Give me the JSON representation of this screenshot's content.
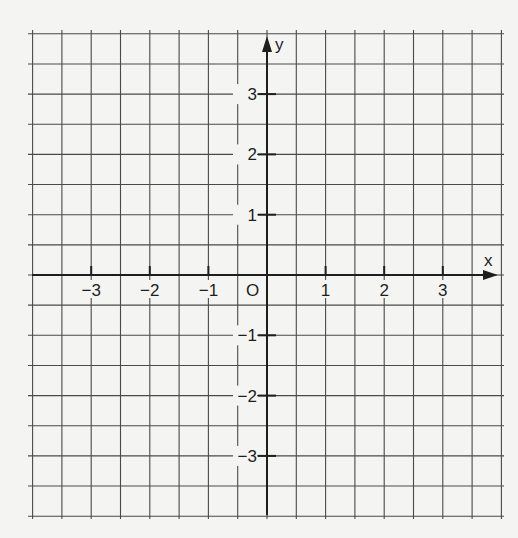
{
  "chart_data": {
    "type": "scatter",
    "title": "",
    "xlabel": "x",
    "ylabel": "y",
    "origin_label": "O",
    "xlim": [
      -4,
      4
    ],
    "ylim": [
      -4,
      4
    ],
    "grid": true,
    "grid_step": 0.5,
    "x_ticks": [
      -3,
      -2,
      -1,
      1,
      2,
      3
    ],
    "y_ticks": [
      -3,
      -2,
      -1,
      1,
      2,
      3
    ],
    "x_tick_labels": [
      "−3",
      "−2",
      "−1",
      "1",
      "2",
      "3"
    ],
    "y_tick_labels": [
      "−3",
      "−2",
      "−1",
      "1",
      "2",
      "3"
    ],
    "series": [],
    "legend": null
  },
  "colors": {
    "background": "#f4f4f2",
    "grid": "#4a4a4a",
    "axis": "#1e1e1e"
  }
}
